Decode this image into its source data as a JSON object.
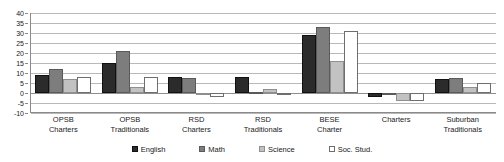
{
  "chart_data": {
    "type": "bar",
    "title": "",
    "xlabel": "",
    "ylabel": "",
    "ylim": [
      -10,
      40
    ],
    "yticks": [
      40,
      35,
      30,
      25,
      20,
      15,
      10,
      5,
      0,
      -5,
      -10
    ],
    "grid": true,
    "legend_position": "bottom",
    "categories": [
      "OPSB\nCharters",
      "OPSB\nTraditionals",
      "RSD\nCharters",
      "RSD\nTraditionals",
      "BESE\nCharter",
      "Charters",
      "Suburban\nTraditionals"
    ],
    "category_lines": [
      [
        "OPSB",
        "Charters"
      ],
      [
        "OPSB",
        "Traditionals"
      ],
      [
        "RSD",
        "Charters"
      ],
      [
        "RSD",
        "Traditionals"
      ],
      [
        "BESE",
        "Charter"
      ],
      [
        "Charters",
        ""
      ],
      [
        "Suburban",
        "Traditionals"
      ]
    ],
    "series": [
      {
        "name": "English",
        "color": "#2b2b2b",
        "values": [
          9,
          15,
          8,
          8,
          29,
          -2,
          7
        ]
      },
      {
        "name": "Math",
        "color": "#7d7d7d",
        "values": [
          12,
          21,
          7.5,
          0.5,
          33,
          0,
          7.5
        ]
      },
      {
        "name": "Science",
        "color": "#c2c2c2",
        "values": [
          7,
          3,
          0,
          2,
          16,
          -4,
          3
        ]
      },
      {
        "name": "Soc. Stud.",
        "color": "#ffffff",
        "values": [
          8,
          8,
          -2,
          0,
          31,
          -4,
          5
        ]
      }
    ]
  },
  "legend": {
    "items": [
      {
        "label": "English"
      },
      {
        "label": "Math"
      },
      {
        "label": "Science"
      },
      {
        "label": "Soc. Stud."
      }
    ]
  }
}
